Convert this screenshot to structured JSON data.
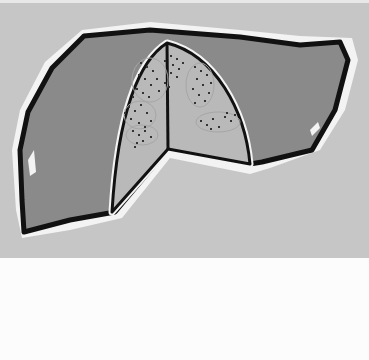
{
  "figure": {
    "colors": {
      "background": "#c6c6c6",
      "page": "#fcfcfc",
      "liver_fill": "#8a8a8a",
      "cutaway_fill": "#b8b8b8",
      "outline": "#111111",
      "halo": "#f2f2f2",
      "lesion_dots": "#333333"
    },
    "elements": [
      "liver-outline",
      "cutaway-wedge",
      "lesion-clusters"
    ]
  }
}
